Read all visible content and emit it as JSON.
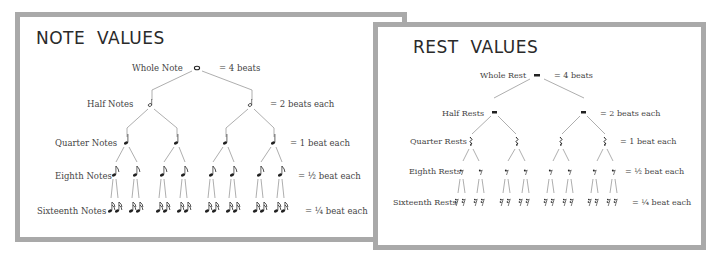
{
  "notes": {
    "title": "NOTE  VALUES",
    "rows": [
      {
        "label": "Whole Note",
        "value": "= 4 beats"
      },
      {
        "label": "Half Notes",
        "value": "= 2 beats each"
      },
      {
        "label": "Quarter Notes",
        "value": "= 1 beat each"
      },
      {
        "label": "Eighth Notes",
        "value": "= ½ beat each"
      },
      {
        "label": "Sixteenth Notes",
        "value": "= ¼ beat each"
      }
    ]
  },
  "rests": {
    "title": "REST  VALUES",
    "rows": [
      {
        "label": "Whole Rest",
        "value": "= 4 beats"
      },
      {
        "label": "Half Rests",
        "value": "= 2 beats each"
      },
      {
        "label": "Quarter Rests",
        "value": "= 1 beat each"
      },
      {
        "label": "Eighth Rests",
        "value": "= ½ beat each"
      },
      {
        "label": "Sixteenth Rests",
        "value": "= ¼ beat each"
      }
    ]
  },
  "colors": {
    "border": "#a9a9a9",
    "line": "#999999",
    "text": "#333333"
  }
}
